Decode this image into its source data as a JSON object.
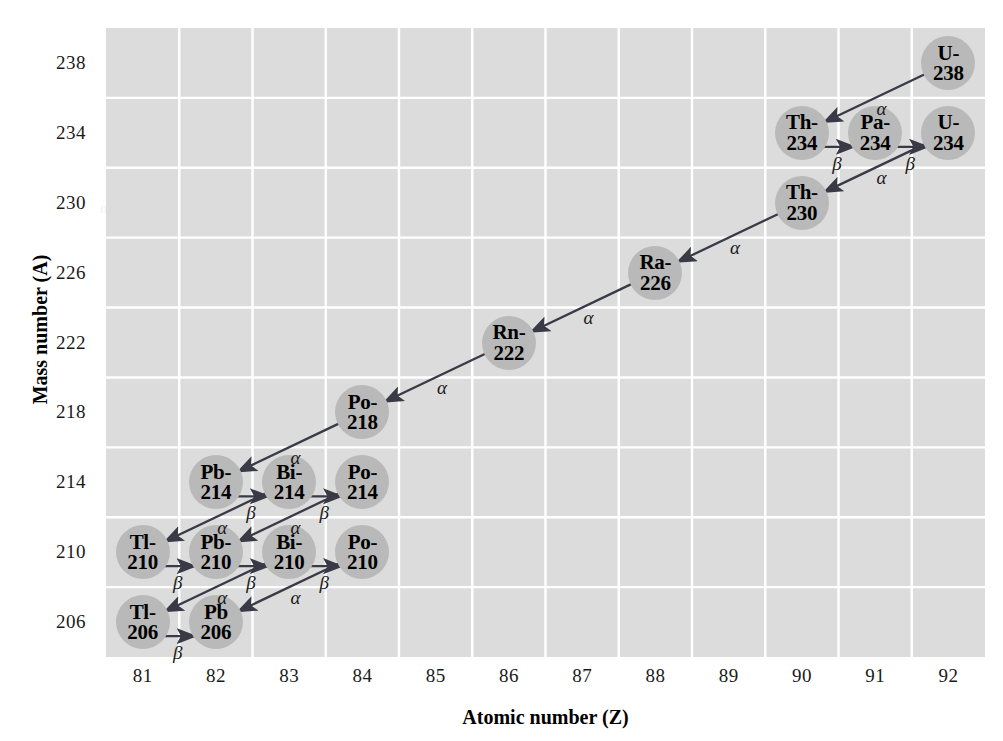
{
  "axes": {
    "x": {
      "label": "Atomic number (Z)",
      "ticks": [
        81,
        82,
        83,
        84,
        85,
        86,
        87,
        88,
        89,
        90,
        91,
        92
      ],
      "min": 80.5,
      "max": 92.5
    },
    "y": {
      "label": "Mass number (A)",
      "ticks": [
        206,
        210,
        214,
        218,
        222,
        226,
        230,
        234,
        238
      ],
      "min": 204,
      "max": 240
    },
    "grid": true
  },
  "colors": {
    "plot_background": "#dcdcdc",
    "gridline": "#ffffff",
    "node_fill": "#b9b9b9",
    "arrow": "#3a3a47",
    "text": "#000000"
  },
  "chart_data": {
    "type": "scatter",
    "xlabel": "Atomic number (Z)",
    "ylabel": "Mass number (A)",
    "xlim": [
      80.5,
      92.5
    ],
    "ylim": [
      204,
      240
    ],
    "grid": true,
    "nodes": [
      {
        "id": "U-238",
        "symbol": "U-",
        "mass": "238",
        "z": 92,
        "a": 238
      },
      {
        "id": "Th-234",
        "symbol": "Th-",
        "mass": "234",
        "z": 90,
        "a": 234
      },
      {
        "id": "Pa-234",
        "symbol": "Pa-",
        "mass": "234",
        "z": 91,
        "a": 234
      },
      {
        "id": "U-234",
        "symbol": "U-",
        "mass": "234",
        "z": 92,
        "a": 234
      },
      {
        "id": "Th-230",
        "symbol": "Th-",
        "mass": "230",
        "z": 90,
        "a": 230
      },
      {
        "id": "Ra-226",
        "symbol": "Ra-",
        "mass": "226",
        "z": 88,
        "a": 226
      },
      {
        "id": "Rn-222",
        "symbol": "Rn-",
        "mass": "222",
        "z": 86,
        "a": 222
      },
      {
        "id": "Po-218",
        "symbol": "Po-",
        "mass": "218",
        "z": 84,
        "a": 218
      },
      {
        "id": "Pb-214",
        "symbol": "Pb-",
        "mass": "214",
        "z": 82,
        "a": 214
      },
      {
        "id": "Bi-214",
        "symbol": "Bi-",
        "mass": "214",
        "z": 83,
        "a": 214
      },
      {
        "id": "Po-214",
        "symbol": "Po-",
        "mass": "214",
        "z": 84,
        "a": 214
      },
      {
        "id": "Tl-210",
        "symbol": "Tl-",
        "mass": "210",
        "z": 81,
        "a": 210
      },
      {
        "id": "Pb-210",
        "symbol": "Pb-",
        "mass": "210",
        "z": 82,
        "a": 210
      },
      {
        "id": "Bi-210",
        "symbol": "Bi-",
        "mass": "210",
        "z": 83,
        "a": 210
      },
      {
        "id": "Po-210",
        "symbol": "Po-",
        "mass": "210",
        "z": 84,
        "a": 210
      },
      {
        "id": "Tl-206",
        "symbol": "Tl-",
        "mass": "206",
        "z": 81,
        "a": 206
      },
      {
        "id": "Pb-206",
        "symbol": "Pb",
        "mass": "206",
        "z": 82,
        "a": 206
      }
    ],
    "decays": [
      {
        "from": "U-238",
        "to": "Th-234",
        "type": "alpha",
        "label": "α"
      },
      {
        "from": "Th-234",
        "to": "Pa-234",
        "type": "beta",
        "label": "β"
      },
      {
        "from": "Pa-234",
        "to": "U-234",
        "type": "beta",
        "label": "β"
      },
      {
        "from": "U-234",
        "to": "Th-230",
        "type": "alpha",
        "label": "α"
      },
      {
        "from": "Th-230",
        "to": "Ra-226",
        "type": "alpha",
        "label": "α"
      },
      {
        "from": "Ra-226",
        "to": "Rn-222",
        "type": "alpha",
        "label": "α"
      },
      {
        "from": "Rn-222",
        "to": "Po-218",
        "type": "alpha",
        "label": "α"
      },
      {
        "from": "Po-218",
        "to": "Pb-214",
        "type": "alpha",
        "label": "α"
      },
      {
        "from": "Pb-214",
        "to": "Bi-214",
        "type": "beta",
        "label": "β"
      },
      {
        "from": "Bi-214",
        "to": "Po-214",
        "type": "beta",
        "label": "β"
      },
      {
        "from": "Bi-214",
        "to": "Tl-210",
        "type": "alpha",
        "label": "α"
      },
      {
        "from": "Po-214",
        "to": "Pb-210",
        "type": "alpha",
        "label": "α"
      },
      {
        "from": "Tl-210",
        "to": "Pb-210",
        "type": "beta",
        "label": "β"
      },
      {
        "from": "Pb-210",
        "to": "Bi-210",
        "type": "beta",
        "label": "β"
      },
      {
        "from": "Bi-210",
        "to": "Po-210",
        "type": "beta",
        "label": "β"
      },
      {
        "from": "Bi-210",
        "to": "Tl-206",
        "type": "alpha",
        "label": "α"
      },
      {
        "from": "Po-210",
        "to": "Pb-206",
        "type": "alpha",
        "label": "α"
      },
      {
        "from": "Tl-206",
        "to": "Pb-206",
        "type": "beta",
        "label": "β"
      }
    ]
  },
  "ghost_text": [
    {
      "text": "the image formation in free space",
      "x": 560,
      "y": 36,
      "size": 15
    },
    {
      "text": "a thin lens of focal length f in an",
      "x": 470,
      "y": 96,
      "size": 15
    },
    {
      "text": "the mirror. Each of these elements",
      "x": 330,
      "y": 152,
      "size": 15
    },
    {
      "text": "the system; so the matrix is written",
      "x": 310,
      "y": 200,
      "size": 15
    },
    {
      "text": "other side again by the back focal",
      "x": 330,
      "y": 238,
      "size": 15
    },
    {
      "text": "practical purposes",
      "x": 360,
      "y": 292,
      "size": 15
    },
    {
      "text": "illustrations",
      "x": 400,
      "y": 346,
      "size": 15
    },
    {
      "text": "the combination and the data section",
      "x": 340,
      "y": 400,
      "size": 15
    },
    {
      "text": "and for a thin lens that the focal",
      "x": 350,
      "y": 440,
      "size": 15
    }
  ]
}
